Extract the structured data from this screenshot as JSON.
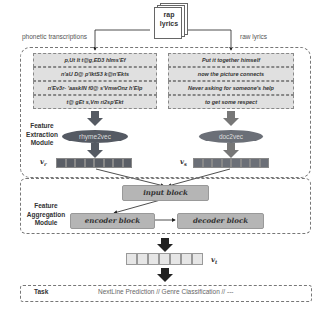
{
  "source": {
    "line1": "rap",
    "line2": "lyrics"
  },
  "branches": {
    "left_label": "phonetic transcriptions",
    "right_label": "raw lyrics"
  },
  "feature_extraction": {
    "label_lines": [
      "Feature",
      "Extraction",
      "Module"
    ],
    "phonetic_rows": [
      "p,Ut It t@g,ED3 hIms'Ef",
      "n'aU D@ p'IktS3 k@n'Ekts",
      "n'Ev3r- 'aaskIN f0@ s'VmwOnz h'Elp",
      "t@ gEt s,Vm ri2sp'Ekt"
    ],
    "raw_rows": [
      "Put it together himself",
      "now the picture connects",
      "Never asking for someone's help",
      "to get some respect"
    ],
    "left_encoder": "rhyme2vec",
    "right_encoder": "doc2vec",
    "left_vector": "v",
    "left_vector_sub": "r",
    "right_vector": "v",
    "right_vector_sub": "s"
  },
  "feature_aggregation": {
    "label_lines": [
      "Feature",
      "Aggregation",
      "Module"
    ],
    "input_block": "input block",
    "encoder_block": "encoder block",
    "decoder_block": "decoder block"
  },
  "output_vector": {
    "label": "v",
    "sub": "t"
  },
  "task": {
    "label": "Task",
    "text": "NextLine Prediction  //  Genre Classification // ---"
  },
  "colors": {
    "dark_fill": "#555a63",
    "block_fill": "#b5b5b5",
    "row_fill": "#e0e0e0",
    "light_cell": "#e6e6e6"
  }
}
